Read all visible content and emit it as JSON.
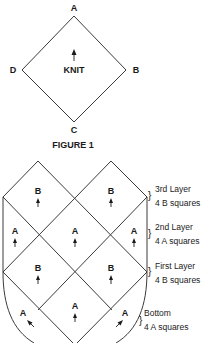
{
  "figure1": {
    "vertex_labels": {
      "top": "A",
      "right": "B",
      "bottom": "C",
      "left": "D"
    },
    "center_label": "KNIT",
    "caption": "FIGURE 1"
  },
  "assembly": {
    "cells": [
      {
        "id": "top-left-b",
        "label": "B",
        "arrow": "up"
      },
      {
        "id": "top-right-b",
        "label": "B",
        "arrow": "up"
      },
      {
        "id": "mid-left-a",
        "label": "A",
        "arrow": "up"
      },
      {
        "id": "mid-center-a",
        "label": "A",
        "arrow": "up"
      },
      {
        "id": "mid-right-a",
        "label": "A",
        "arrow": "up"
      },
      {
        "id": "low-left-b",
        "label": "B",
        "arrow": "up"
      },
      {
        "id": "low-right-b",
        "label": "B",
        "arrow": "up"
      },
      {
        "id": "bottom-left-a",
        "label": "A",
        "arrow": "up-left"
      },
      {
        "id": "bottom-center-a",
        "label": "A",
        "arrow": "up"
      },
      {
        "id": "bottom-right-a",
        "label": "A",
        "arrow": "up-right"
      }
    ],
    "layers": [
      {
        "title": "3rd Layer",
        "detail": "4 B squares"
      },
      {
        "title": "2nd Layer",
        "detail": "4 A squares"
      },
      {
        "title": "First Layer",
        "detail": "4 B squares"
      },
      {
        "title": "Bottom",
        "detail": "4 A squares"
      }
    ],
    "brace_glyph": "}"
  }
}
